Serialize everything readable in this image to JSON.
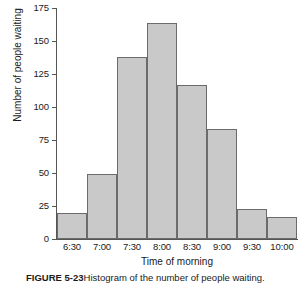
{
  "figure": {
    "caption_label": "FIGURE 5-23",
    "caption_text": "Histogram of the number of people waiting."
  },
  "colors": {
    "bar_fill": "#c9c9c9",
    "bar_border": "#6b6b6b",
    "axis": "#555555",
    "text": "#1a1a1a",
    "background": "#ffffff"
  },
  "chart_data": {
    "type": "bar",
    "title": "",
    "subtitle": "",
    "xlabel": "Time of morning",
    "ylabel": "Number of people waiting",
    "categories": [
      "6:30",
      "7:00",
      "7:30",
      "8:00",
      "8:30",
      "9:00",
      "9:30",
      "10:00"
    ],
    "values": [
      20,
      49,
      138,
      164,
      117,
      83,
      23,
      17
    ],
    "ylim": [
      0,
      175
    ],
    "yticks": [
      0,
      25,
      50,
      75,
      100,
      125,
      150,
      175
    ],
    "ytick_labels": [
      "0",
      "25",
      "50",
      "75",
      "100",
      "125",
      "150",
      "175"
    ],
    "grid": false,
    "legend": false,
    "legend_position": "none",
    "bar_gap": 0,
    "orientation": "vertical"
  }
}
